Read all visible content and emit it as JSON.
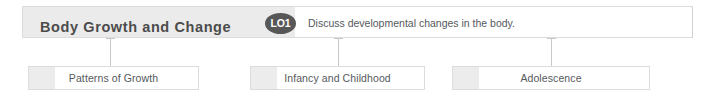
{
  "header": {
    "title": "Body Growth and Change",
    "badge_label": "LO1",
    "description": "Discuss developmental changes in the body.",
    "band_color": "#ebebeb",
    "badge_color": "#575757",
    "title_color": "#4c4c4c",
    "border_color": "#dcdcdc"
  },
  "topics": [
    {
      "label": "Patterns of Growth"
    },
    {
      "label": "Infancy and Childhood"
    },
    {
      "label": "Adolescence"
    }
  ],
  "connectors": [
    {
      "name": "connector-patterns-of-growth"
    },
    {
      "name": "connector-infancy-and-childhood"
    },
    {
      "name": "connector-adolescence"
    }
  ]
}
